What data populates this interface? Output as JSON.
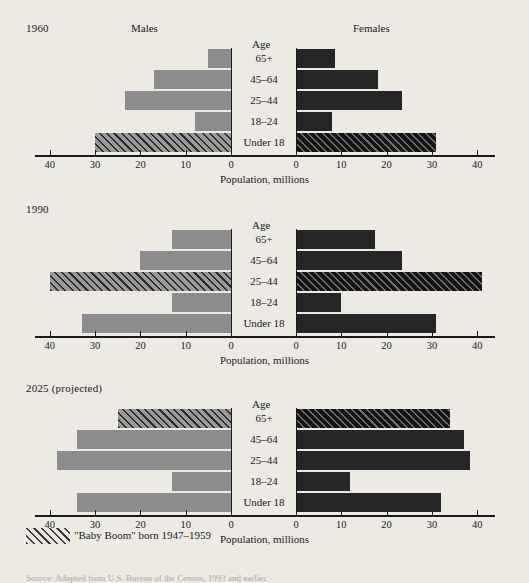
{
  "figure": {
    "background_color": "#edeae4",
    "male_color": "#8c8c8c",
    "female_color": "#262626",
    "axis_title": "Population, millions",
    "males_header": "Males",
    "females_header": "Females",
    "age_header": "Age",
    "legend_label": "\"Baby Boom\" born 1947–1959",
    "source": "Source: Adapted from U.S. Bureau of the Census, 1993 and earlier."
  },
  "chart_data": {
    "type": "bar",
    "subtype": "population-pyramid",
    "title": "",
    "xlabel": "Population, millions",
    "ylabel": "Age",
    "xlim": [
      0,
      45
    ],
    "tick_values": [
      40,
      30,
      20,
      10,
      0
    ],
    "tick_values_right": [
      0,
      10,
      20,
      30,
      40
    ],
    "categories": [
      "65+",
      "45–64",
      "25–44",
      "18–24",
      "Under 18"
    ],
    "grid": false,
    "legend": "\"Baby Boom\" born 1947–1959",
    "legend_position": "below-plot",
    "panels": [
      {
        "year": "1960",
        "series": [
          {
            "name": "Males",
            "side": "left",
            "values": [
              5.0,
              17.0,
              23.5,
              8.0,
              30.0
            ],
            "boom_flags": [
              false,
              false,
              false,
              false,
              true
            ]
          },
          {
            "name": "Females",
            "side": "right",
            "values": [
              8.5,
              18.0,
              23.5,
              8.0,
              31.0
            ],
            "boom_flags": [
              false,
              false,
              false,
              false,
              true
            ]
          }
        ]
      },
      {
        "year": "1990",
        "series": [
          {
            "name": "Males",
            "side": "left",
            "values": [
              13.0,
              20.0,
              40.0,
              13.0,
              33.0
            ],
            "boom_flags": [
              false,
              false,
              true,
              false,
              false
            ]
          },
          {
            "name": "Females",
            "side": "right",
            "values": [
              17.5,
              23.5,
              41.0,
              10.0,
              31.0
            ],
            "boom_flags": [
              false,
              false,
              true,
              false,
              false
            ]
          }
        ]
      },
      {
        "year": "2025 (projected)",
        "series": [
          {
            "name": "Males",
            "side": "left",
            "values": [
              25.0,
              34.0,
              38.5,
              13.0,
              34.0
            ],
            "boom_flags": [
              true,
              false,
              false,
              false,
              false
            ]
          },
          {
            "name": "Females",
            "side": "right",
            "values": [
              34.0,
              37.0,
              38.5,
              12.0,
              32.0
            ],
            "boom_flags": [
              true,
              false,
              false,
              false,
              false
            ]
          }
        ]
      }
    ]
  }
}
